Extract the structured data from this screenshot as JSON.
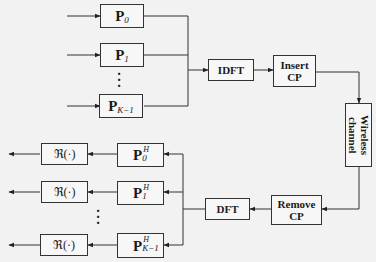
{
  "transmitter": {
    "precoders": [
      {
        "base": "P",
        "sub": "0"
      },
      {
        "base": "P",
        "sub": "1"
      },
      {
        "base": "P",
        "sub": "K−1"
      }
    ],
    "idft": "IDFT",
    "insert_cp_line1": "Insert",
    "insert_cp_line2": "CP"
  },
  "channel": {
    "label_line1": "Wireless",
    "label_line2": "channel"
  },
  "receiver": {
    "remove_cp_line1": "Remove",
    "remove_cp_line2": "CP",
    "dft": "DFT",
    "decoders": [
      {
        "base": "P",
        "sub": "0",
        "sup": "H"
      },
      {
        "base": "P",
        "sub": "1",
        "sup": "H"
      },
      {
        "base": "P",
        "sub": "K−1",
        "sup": "H"
      }
    ],
    "real_ops": [
      "ℜ(·)",
      "ℜ(·)",
      "ℜ(·)"
    ]
  },
  "ellipsis": "⋮"
}
